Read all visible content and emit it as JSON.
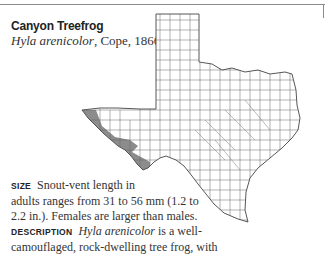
{
  "entry": {
    "common_name": "Canyon Treefrog",
    "scientific_name": "Hyla arenicolor",
    "authority": ", Cope, 1866"
  },
  "map": {
    "region": "Texas counties",
    "range_fill": "#8c8c8c",
    "county_line": "#555555"
  },
  "size": {
    "label": "SIZE",
    "line1": "Snout-vent length in",
    "line2": "adults ranges from 31 to 56 mm (1.2 to",
    "line3": "2.2 in.). Females are larger than males."
  },
  "description": {
    "label": "DESCRIPTION",
    "species": "Hyla arenicolor",
    "text1_a": "is",
    "text1_b": "a",
    "text1_c": "well-",
    "line2": "camouflaged, rock-dwelling tree frog, with"
  }
}
